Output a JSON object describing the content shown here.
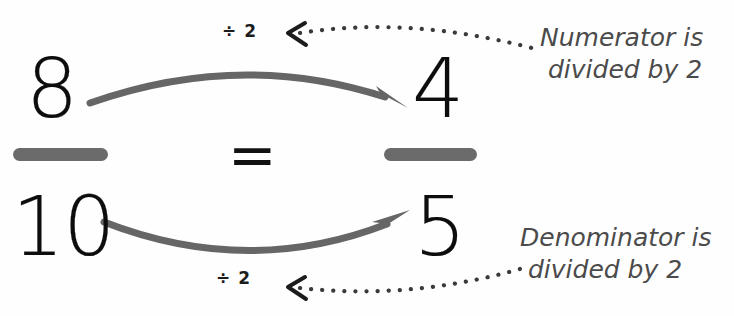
{
  "background_color": "#fefefe",
  "colors": {
    "numeral": "#0d0d0d",
    "fraction_bar": "#6b6b6b",
    "curved_arrow": "#666666",
    "dotted_leader": "#3a3a3a",
    "callout_text": "#4b4b4b",
    "op_label": "#1c1c1c"
  },
  "equation": {
    "left_fraction": {
      "numerator": "8",
      "denominator": "10"
    },
    "relation": "=",
    "right_fraction": {
      "numerator": "4",
      "denominator": "5"
    }
  },
  "operations": {
    "numerator_op": "÷ 2",
    "denominator_op": "÷ 2"
  },
  "callouts": {
    "numerator": {
      "line1": "Numerator is",
      "line2": "divided by 2"
    },
    "denominator": {
      "line1": "Denominator is",
      "line2": "divided by 2"
    }
  }
}
